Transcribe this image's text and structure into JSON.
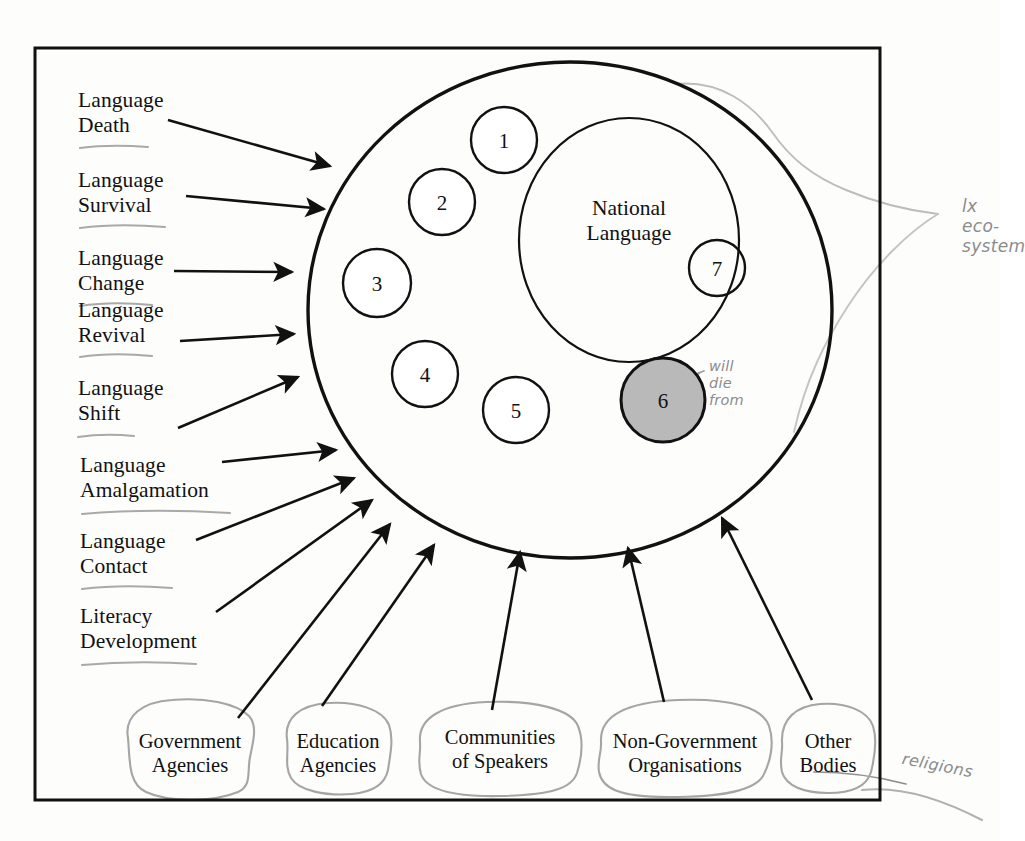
{
  "figure": {
    "frame": {
      "name": "diagram-border"
    }
  },
  "ellipse": {
    "name": "language-ecosystem-ellipse",
    "inner_label": "National\nLanguage",
    "inner_label_line1": "National",
    "inner_label_line2": "Language"
  },
  "numbered_circles": [
    {
      "id": "1",
      "label": "1",
      "cx": 504,
      "cy": 140,
      "r": 33,
      "shaded": false
    },
    {
      "id": "2",
      "label": "2",
      "cx": 442,
      "cy": 202,
      "r": 33,
      "shaded": false
    },
    {
      "id": "3",
      "label": "3",
      "cx": 377,
      "cy": 283,
      "r": 34,
      "shaded": false
    },
    {
      "id": "4",
      "label": "4",
      "cx": 425,
      "cy": 374,
      "r": 33,
      "shaded": false
    },
    {
      "id": "5",
      "label": "5",
      "cx": 516,
      "cy": 410,
      "r": 33,
      "shaded": false
    },
    {
      "id": "6",
      "label": "6",
      "cx": 663,
      "cy": 400,
      "r": 42,
      "shaded": true
    },
    {
      "id": "7",
      "label": "7",
      "cx": 717,
      "cy": 268,
      "r": 28,
      "shaded": false
    }
  ],
  "process_labels": [
    {
      "line1": "Language",
      "line2": "Death"
    },
    {
      "line1": "Language",
      "line2": "Survival"
    },
    {
      "line1": "Language",
      "line2": "Change"
    },
    {
      "line1": "Language",
      "line2": "Revival"
    },
    {
      "line1": "Language",
      "line2": "Shift"
    },
    {
      "line1": "Language",
      "line2": "Amalgamation"
    },
    {
      "line1": "Language",
      "line2": "Contact"
    },
    {
      "line1": "Literacy",
      "line2": "Development"
    }
  ],
  "actor_blobs": [
    {
      "line1": "Government",
      "line2": "Agencies"
    },
    {
      "line1": "Education",
      "line2": "Agencies"
    },
    {
      "line1": "Communities",
      "line2": "of Speakers"
    },
    {
      "line1": "Non-Government",
      "line2": "Organisations"
    },
    {
      "line1": "Other",
      "line2": "Bodies"
    }
  ],
  "annotations": [
    {
      "name": "lx-ecosystem-note",
      "lines": [
        "lx",
        "eco-",
        "system"
      ],
      "text": "lx eco-system"
    },
    {
      "name": "will-die-from-note",
      "lines": [
        "will",
        "die",
        "from"
      ],
      "text": "will die from"
    },
    {
      "name": "religions-note",
      "lines": [
        "religions"
      ],
      "text": "religions"
    }
  ],
  "colors": {
    "ink": "#111111",
    "paper": "#fdfdfc",
    "pencil": "#9a9a9a",
    "shaded_circle_fill": "#b9b9b9",
    "underline": "#a8a8a8"
  }
}
